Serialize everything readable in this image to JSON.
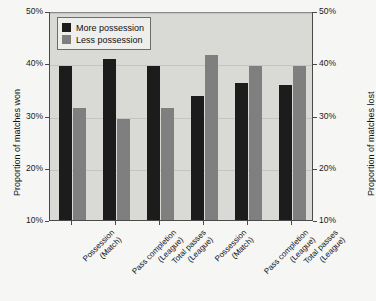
{
  "chart_data": {
    "type": "bar",
    "title": "",
    "subtitle": "",
    "xlabel": "",
    "ylabel": "Proportion of matches won",
    "ylabel_right": "Proportion of matches lost",
    "ylim": [
      10,
      50
    ],
    "ytick_labels": [
      "10%",
      "20%",
      "30%",
      "40%",
      "50%"
    ],
    "ytick_values": [
      10,
      20,
      30,
      40,
      50
    ],
    "ytick_labels_right": [
      "10%",
      "20%",
      "30%",
      "40%",
      "50%"
    ],
    "grid": true,
    "legend_position": "upper-left",
    "categories": [
      {
        "line1": "Possession",
        "line2": "(Match)"
      },
      {
        "line1": "Pass completion",
        "line2": "(League)"
      },
      {
        "line1": "Total passes",
        "line2": "(League)"
      },
      {
        "line1": "Possession",
        "line2": "(Match)"
      },
      {
        "line1": "Pass completion",
        "line2": "(League)"
      },
      {
        "line1": "Total passes",
        "line2": "(League)"
      }
    ],
    "series": [
      {
        "name": "More possession",
        "color": "#1c1c1c",
        "values": [
          39.4,
          40.8,
          39.4,
          33.8,
          36.2,
          35.9
        ]
      },
      {
        "name": "Less possession",
        "color": "#7f7f7f",
        "values": [
          31.5,
          29.4,
          31.5,
          41.5,
          39.4,
          39.5
        ]
      }
    ],
    "legend": [
      {
        "label": "More possession",
        "swatch": "#1c1c1c"
      },
      {
        "label": "Less possession",
        "swatch": "#7f7f7f"
      }
    ],
    "colors": {
      "more_possession": "#1c1c1c",
      "less_possession": "#7f7f7f",
      "plot_background": "#d9d9d5",
      "figure_background": "#f6f6f4",
      "gridline": "#c4c4c0",
      "axis": "#4a4a4a"
    }
  }
}
